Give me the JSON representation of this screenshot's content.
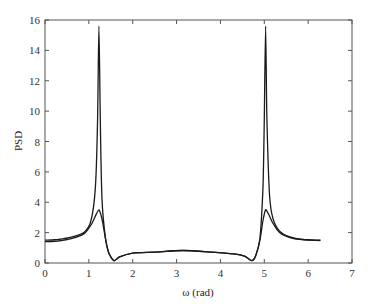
{
  "chart_data": {
    "type": "line",
    "title": "",
    "xlabel": "ω (rad)",
    "ylabel": "PSD",
    "xlim": [
      0,
      7
    ],
    "ylim": [
      0,
      16
    ],
    "xticks": [
      0,
      1,
      2,
      3,
      4,
      5,
      6,
      7
    ],
    "yticks": [
      0,
      2,
      4,
      6,
      8,
      10,
      12,
      14,
      16
    ],
    "grid": false,
    "legend": null,
    "series": [
      {
        "name": "PSD (sharp)",
        "x": [
          0,
          0.3,
          0.6,
          0.9,
          1.05,
          1.15,
          1.2,
          1.23,
          1.26,
          1.3,
          1.38,
          1.45,
          1.57,
          1.7,
          2.0,
          2.5,
          3.14,
          3.8,
          4.3,
          4.55,
          4.71,
          4.8,
          4.9,
          4.97,
          5.0,
          5.03,
          5.06,
          5.12,
          5.2,
          5.35,
          5.6,
          5.9,
          6.28
        ],
        "y": [
          1.5,
          1.55,
          1.7,
          2.05,
          2.8,
          5.0,
          9.5,
          15.6,
          9.5,
          4.2,
          1.6,
          0.7,
          0.15,
          0.4,
          0.65,
          0.72,
          0.82,
          0.72,
          0.6,
          0.45,
          0.15,
          0.45,
          1.6,
          5.0,
          9.5,
          15.6,
          9.5,
          4.5,
          2.9,
          2.1,
          1.7,
          1.55,
          1.5
        ]
      },
      {
        "name": "PSD (smooth)",
        "x": [
          0,
          0.3,
          0.6,
          0.9,
          1.05,
          1.15,
          1.23,
          1.3,
          1.38,
          1.45,
          1.57,
          1.7,
          2.0,
          2.5,
          3.14,
          3.8,
          4.3,
          4.55,
          4.71,
          4.8,
          4.9,
          4.97,
          5.03,
          5.1,
          5.2,
          5.35,
          5.6,
          5.9,
          6.28
        ],
        "y": [
          1.4,
          1.45,
          1.6,
          1.95,
          2.5,
          3.1,
          3.5,
          2.9,
          1.6,
          0.7,
          0.15,
          0.4,
          0.65,
          0.72,
          0.82,
          0.72,
          0.6,
          0.45,
          0.15,
          0.45,
          1.5,
          2.8,
          3.5,
          3.2,
          2.6,
          2.0,
          1.65,
          1.52,
          1.48
        ]
      }
    ]
  }
}
